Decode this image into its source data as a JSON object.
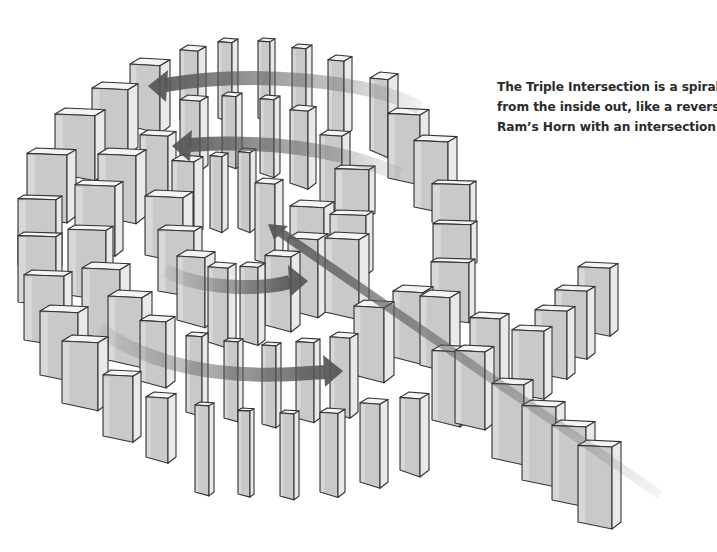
{
  "figure": {
    "caption_lines": [
      "The Triple Intersection is a spiral",
      "from the inside out, like a reverse",
      "Ram’s Horn with an intersection."
    ]
  },
  "colors": {
    "background": "#ffffff",
    "domino_face": "#c9c9c9",
    "domino_side": "#e9e9e9",
    "domino_top": "#f4f4f4",
    "domino_outline": "#333333",
    "arrow": "#555555",
    "caption_text": "#2b2b2b"
  },
  "arrows": [
    {
      "name": "top-arrow-leftward",
      "d": "M 420 108 C 370 80 250 70 165 85",
      "head": [
        148,
        86
      ],
      "dir": "left"
    },
    {
      "name": "second-arrow-leftward",
      "d": "M 400 175 C 340 148 260 140 190 145",
      "head": [
        172,
        146
      ],
      "dir": "left"
    },
    {
      "name": "middle-arrow-rightward",
      "d": "M 165 270 C 200 290 260 290 290 282",
      "head": [
        308,
        281
      ],
      "dir": "right"
    },
    {
      "name": "bottom-arrow-rightward",
      "d": "M 100 330 C 180 385 280 375 325 372",
      "head": [
        343,
        371
      ],
      "dir": "right"
    },
    {
      "name": "intersection-arrow-diagonal",
      "d": "M 660 495 L 280 232",
      "head": [
        268,
        224
      ],
      "dir": "upleft"
    }
  ],
  "dominoes": [
    {
      "x": 180,
      "y": 45,
      "w": 18,
      "h": 75,
      "d": 8
    },
    {
      "x": 218,
      "y": 38,
      "w": 14,
      "h": 80,
      "d": 6
    },
    {
      "x": 258,
      "y": 38,
      "w": 12,
      "h": 80,
      "d": 5
    },
    {
      "x": 292,
      "y": 44,
      "w": 14,
      "h": 75,
      "d": 6
    },
    {
      "x": 328,
      "y": 55,
      "w": 16,
      "h": 75,
      "d": 8
    },
    {
      "x": 370,
      "y": 72,
      "w": 18,
      "h": 78,
      "d": 10
    },
    {
      "x": 130,
      "y": 58,
      "w": 30,
      "h": 68,
      "d": 10
    },
    {
      "x": 92,
      "y": 82,
      "w": 36,
      "h": 65,
      "d": 10
    },
    {
      "x": 55,
      "y": 108,
      "w": 40,
      "h": 65,
      "d": 10
    },
    {
      "x": 27,
      "y": 148,
      "w": 40,
      "h": 68,
      "d": 9
    },
    {
      "x": 18,
      "y": 195,
      "w": 38,
      "h": 70,
      "d": 6
    },
    {
      "x": 18,
      "y": 232,
      "w": 38,
      "h": 70,
      "d": 6
    },
    {
      "x": 24,
      "y": 270,
      "w": 40,
      "h": 70,
      "d": 8
    },
    {
      "x": 40,
      "y": 305,
      "w": 38,
      "h": 70,
      "d": 10
    },
    {
      "x": 62,
      "y": 335,
      "w": 36,
      "h": 68,
      "d": 10
    },
    {
      "x": 103,
      "y": 370,
      "w": 30,
      "h": 66,
      "d": 8
    },
    {
      "x": 146,
      "y": 392,
      "w": 22,
      "h": 65,
      "d": 8
    },
    {
      "x": 195,
      "y": 402,
      "w": 14,
      "h": 90,
      "d": 5
    },
    {
      "x": 238,
      "y": 408,
      "w": 12,
      "h": 86,
      "d": 4
    },
    {
      "x": 280,
      "y": 410,
      "w": 14,
      "h": 86,
      "d": 5
    },
    {
      "x": 320,
      "y": 408,
      "w": 18,
      "h": 84,
      "d": 7
    },
    {
      "x": 360,
      "y": 398,
      "w": 20,
      "h": 84,
      "d": 8
    },
    {
      "x": 400,
      "y": 392,
      "w": 20,
      "h": 78,
      "d": 9
    },
    {
      "x": 432,
      "y": 345,
      "w": 28,
      "h": 75,
      "d": 9
    },
    {
      "x": 388,
      "y": 108,
      "w": 32,
      "h": 70,
      "d": 9
    },
    {
      "x": 414,
      "y": 135,
      "w": 34,
      "h": 72,
      "d": 9
    },
    {
      "x": 432,
      "y": 180,
      "w": 38,
      "h": 42,
      "d": 6
    },
    {
      "x": 433,
      "y": 220,
      "w": 38,
      "h": 42,
      "d": 6
    },
    {
      "x": 431,
      "y": 258,
      "w": 38,
      "h": 60,
      "d": 6
    },
    {
      "x": 140,
      "y": 130,
      "w": 28,
      "h": 68,
      "d": 8
    },
    {
      "x": 98,
      "y": 148,
      "w": 38,
      "h": 68,
      "d": 10
    },
    {
      "x": 75,
      "y": 180,
      "w": 40,
      "h": 70,
      "d": 8
    },
    {
      "x": 68,
      "y": 225,
      "w": 38,
      "h": 70,
      "d": 7
    },
    {
      "x": 82,
      "y": 262,
      "w": 38,
      "h": 72,
      "d": 10
    },
    {
      "x": 108,
      "y": 290,
      "w": 34,
      "h": 70,
      "d": 10
    },
    {
      "x": 140,
      "y": 315,
      "w": 26,
      "h": 66,
      "d": 9
    },
    {
      "x": 186,
      "y": 332,
      "w": 16,
      "h": 80,
      "d": 6
    },
    {
      "x": 224,
      "y": 338,
      "w": 14,
      "h": 80,
      "d": 5
    },
    {
      "x": 262,
      "y": 342,
      "w": 14,
      "h": 82,
      "d": 5
    },
    {
      "x": 296,
      "y": 338,
      "w": 18,
      "h": 80,
      "d": 6
    },
    {
      "x": 330,
      "y": 332,
      "w": 20,
      "h": 80,
      "d": 8
    },
    {
      "x": 354,
      "y": 300,
      "w": 30,
      "h": 75,
      "d": 10
    },
    {
      "x": 180,
      "y": 95,
      "w": 20,
      "h": 70,
      "d": 8
    },
    {
      "x": 222,
      "y": 92,
      "w": 14,
      "h": 72,
      "d": 6
    },
    {
      "x": 260,
      "y": 95,
      "w": 14,
      "h": 78,
      "d": 6
    },
    {
      "x": 290,
      "y": 105,
      "w": 18,
      "h": 78,
      "d": 8
    },
    {
      "x": 320,
      "y": 130,
      "w": 22,
      "h": 75,
      "d": 8
    },
    {
      "x": 335,
      "y": 165,
      "w": 34,
      "h": 48,
      "d": 6
    },
    {
      "x": 330,
      "y": 210,
      "w": 36,
      "h": 60,
      "d": 7
    },
    {
      "x": 145,
      "y": 190,
      "w": 38,
      "h": 65,
      "d": 10
    },
    {
      "x": 158,
      "y": 225,
      "w": 36,
      "h": 66,
      "d": 8
    },
    {
      "x": 177,
      "y": 250,
      "w": 28,
      "h": 70,
      "d": 10
    },
    {
      "x": 208,
      "y": 262,
      "w": 20,
      "h": 80,
      "d": 8
    },
    {
      "x": 240,
      "y": 262,
      "w": 18,
      "h": 78,
      "d": 7
    },
    {
      "x": 265,
      "y": 250,
      "w": 26,
      "h": 75,
      "d": 9
    },
    {
      "x": 288,
      "y": 232,
      "w": 30,
      "h": 78,
      "d": 10
    },
    {
      "x": 210,
      "y": 152,
      "w": 12,
      "h": 76,
      "d": 6
    },
    {
      "x": 238,
      "y": 148,
      "w": 12,
      "h": 80,
      "d": 6
    },
    {
      "x": 255,
      "y": 178,
      "w": 20,
      "h": 82,
      "d": 8
    },
    {
      "x": 172,
      "y": 155,
      "w": 22,
      "h": 74,
      "d": 9
    },
    {
      "x": 325,
      "y": 232,
      "w": 34,
      "h": 80,
      "d": 10
    },
    {
      "x": 290,
      "y": 200,
      "w": 34,
      "h": 50,
      "d": 10
    },
    {
      "x": 393,
      "y": 285,
      "w": 30,
      "h": 72,
      "d": 10
    },
    {
      "x": 420,
      "y": 290,
      "w": 30,
      "h": 75,
      "d": 10
    },
    {
      "x": 455,
      "y": 345,
      "w": 30,
      "h": 78,
      "d": 9
    },
    {
      "x": 470,
      "y": 312,
      "w": 30,
      "h": 70,
      "d": 9
    },
    {
      "x": 492,
      "y": 378,
      "w": 32,
      "h": 80,
      "d": 9
    },
    {
      "x": 512,
      "y": 325,
      "w": 32,
      "h": 68,
      "d": 8
    },
    {
      "x": 535,
      "y": 305,
      "w": 32,
      "h": 68,
      "d": 8
    },
    {
      "x": 555,
      "y": 285,
      "w": 32,
      "h": 68,
      "d": 8
    },
    {
      "x": 578,
      "y": 262,
      "w": 32,
      "h": 68,
      "d": 8
    },
    {
      "x": 522,
      "y": 400,
      "w": 34,
      "h": 80,
      "d": 9
    },
    {
      "x": 552,
      "y": 420,
      "w": 34,
      "h": 80,
      "d": 9
    },
    {
      "x": 578,
      "y": 440,
      "w": 34,
      "h": 82,
      "d": 9
    }
  ]
}
